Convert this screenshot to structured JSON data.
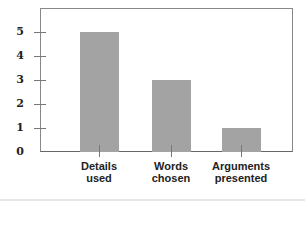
{
  "chart_data": {
    "type": "bar",
    "title": "",
    "xlabel": "",
    "ylabel": "",
    "categories": [
      "Details used",
      "Words chosen",
      "Arguments presented"
    ],
    "category_lines": [
      [
        "Details",
        "used"
      ],
      [
        "Words",
        "chosen"
      ],
      [
        "Arguments",
        "presented"
      ]
    ],
    "values": [
      5,
      3,
      1
    ],
    "ylim": [
      0,
      6
    ],
    "yticks": [
      "0",
      "1",
      "2",
      "3",
      "4",
      "5"
    ],
    "grid": false,
    "legend": null,
    "bar_color": "#a3a3a3"
  }
}
